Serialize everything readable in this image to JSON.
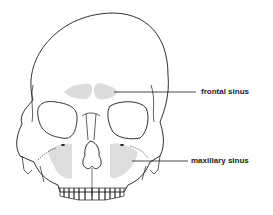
{
  "diagram": {
    "labels": [
      {
        "id": "frontal",
        "text": "frontal sinus"
      },
      {
        "id": "maxillary",
        "text": "maxillary sinus"
      }
    ],
    "colors": {
      "outline": "#1a1a1a",
      "sinus_fill": "#d9d9d9",
      "background": "#ffffff"
    }
  }
}
